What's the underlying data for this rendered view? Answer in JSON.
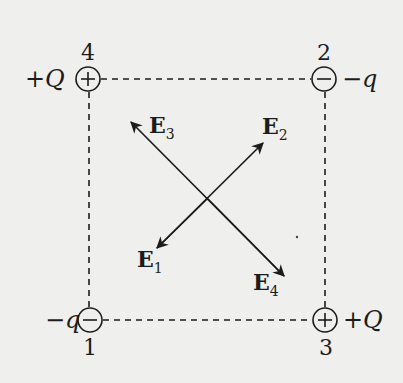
{
  "charges": [
    {
      "index": "4",
      "sign": "+",
      "value": "+Q",
      "position": "top-left"
    },
    {
      "index": "2",
      "sign": "−",
      "value": "−q",
      "position": "top-right"
    },
    {
      "index": "1",
      "sign": "−",
      "value": "−q",
      "position": "bottom-left"
    },
    {
      "index": "3",
      "sign": "+",
      "value": "+Q",
      "position": "bottom-right"
    }
  ],
  "fields": [
    {
      "label": "E",
      "sub": "1",
      "direction": "toward bottom-left"
    },
    {
      "label": "E",
      "sub": "2",
      "direction": "toward top-right"
    },
    {
      "label": "E",
      "sub": "3",
      "direction": "toward top-left"
    },
    {
      "label": "E",
      "sub": "4",
      "direction": "toward bottom-right"
    }
  ],
  "colors": {
    "ink": "#1c1c1c",
    "background": "#efefed"
  }
}
